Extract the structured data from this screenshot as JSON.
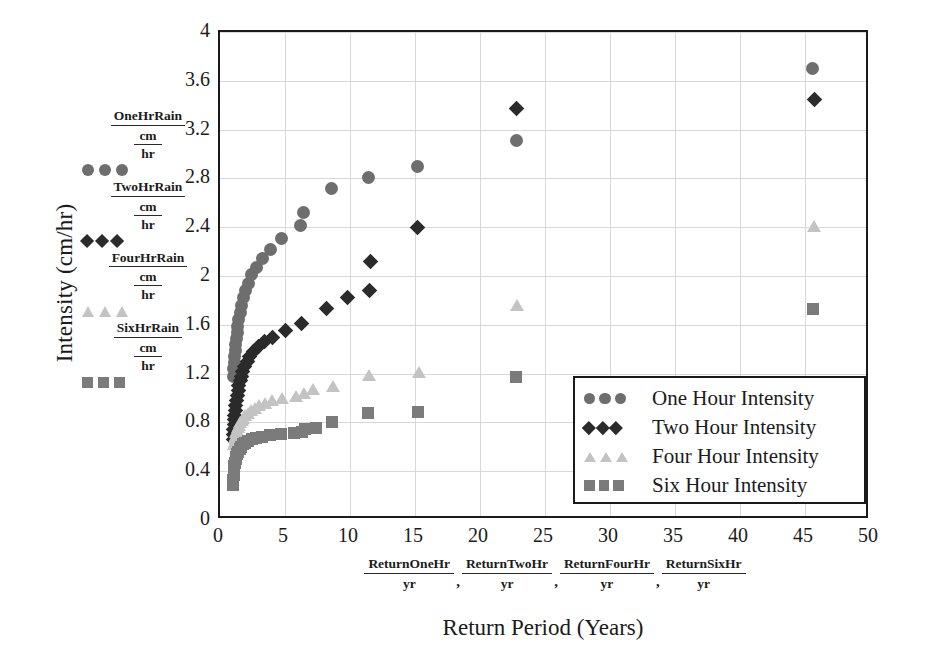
{
  "axes": {
    "y_title": "Intensity (cm/hr)",
    "x_title": "Return Period (Years)",
    "y_ticks": [
      "0",
      "0.4",
      "0.8",
      "1.2",
      "1.6",
      "2",
      "2.4",
      "2.8",
      "3.2",
      "3.6",
      "4"
    ],
    "x_ticks": [
      "0",
      "5",
      "10",
      "15",
      "20",
      "25",
      "30",
      "35",
      "40",
      "45",
      "50"
    ]
  },
  "left_legend": {
    "items": [
      {
        "numerator": "OneHrRain",
        "unit_top": "cm",
        "unit_bottom": "hr",
        "marker": "circle",
        "color": "#6e6e6e"
      },
      {
        "numerator": "TwoHrRain",
        "unit_top": "cm",
        "unit_bottom": "hr",
        "marker": "diamond",
        "color": "#2b2b2b"
      },
      {
        "numerator": "FourHrRain",
        "unit_top": "cm",
        "unit_bottom": "hr",
        "marker": "triangle",
        "color": "#c3c3c3"
      },
      {
        "numerator": "SixHrRain",
        "unit_top": "cm",
        "unit_bottom": "hr",
        "marker": "square",
        "color": "#7b7b7b"
      }
    ]
  },
  "x_fraction_row": {
    "items": [
      {
        "numerator": "ReturnOneHr",
        "denominator": "yr"
      },
      {
        "numerator": "ReturnTwoHr",
        "denominator": "yr"
      },
      {
        "numerator": "ReturnFourHr",
        "denominator": "yr"
      },
      {
        "numerator": "ReturnSixHr",
        "denominator": "yr"
      }
    ],
    "separator": ","
  },
  "series_legend": {
    "items": [
      {
        "label": "One Hour Intensity",
        "marker": "circle",
        "color": "#6e6e6e"
      },
      {
        "label": "Two Hour Intensity",
        "marker": "diamond",
        "color": "#2b2b2b"
      },
      {
        "label": "Four Hour Intensity",
        "marker": "triangle",
        "color": "#c3c3c3"
      },
      {
        "label": "Six Hour Intensity",
        "marker": "square",
        "color": "#7b7b7b"
      }
    ]
  },
  "chart_data": {
    "type": "scatter",
    "title": "",
    "xlabel": "Return Period (Years)",
    "ylabel": "Intensity (cm/hr)",
    "xlim": [
      0,
      50
    ],
    "ylim": [
      0,
      4
    ],
    "xtick_step": 5,
    "ytick_step": 0.4,
    "grid": true,
    "legend_position": "inside-lower-right",
    "series": [
      {
        "name": "One Hour Intensity",
        "marker": "circle",
        "color": "#6e6e6e",
        "points": [
          [
            1.02,
            1.18
          ],
          [
            1.05,
            1.24
          ],
          [
            1.08,
            1.29
          ],
          [
            1.12,
            1.34
          ],
          [
            1.16,
            1.39
          ],
          [
            1.2,
            1.44
          ],
          [
            1.25,
            1.49
          ],
          [
            1.31,
            1.54
          ],
          [
            1.38,
            1.59
          ],
          [
            1.46,
            1.64
          ],
          [
            1.55,
            1.7
          ],
          [
            1.66,
            1.76
          ],
          [
            1.8,
            1.82
          ],
          [
            1.97,
            1.88
          ],
          [
            2.18,
            1.94
          ],
          [
            2.45,
            2.01
          ],
          [
            2.8,
            2.07
          ],
          [
            3.25,
            2.14
          ],
          [
            3.85,
            2.22
          ],
          [
            4.7,
            2.31
          ],
          [
            6.2,
            2.41
          ],
          [
            6.45,
            2.52
          ],
          [
            8.6,
            2.72
          ],
          [
            11.4,
            2.81
          ],
          [
            15.2,
            2.9
          ],
          [
            22.8,
            3.11
          ],
          [
            45.6,
            3.7
          ]
        ]
      },
      {
        "name": "Two Hour Intensity",
        "marker": "diamond",
        "color": "#2b2b2b",
        "points": [
          [
            1.02,
            0.66
          ],
          [
            1.04,
            0.7
          ],
          [
            1.06,
            0.74
          ],
          [
            1.09,
            0.78
          ],
          [
            1.12,
            0.82
          ],
          [
            1.15,
            0.86
          ],
          [
            1.19,
            0.9
          ],
          [
            1.23,
            0.94
          ],
          [
            1.28,
            0.98
          ],
          [
            1.33,
            1.02
          ],
          [
            1.39,
            1.06
          ],
          [
            1.46,
            1.1
          ],
          [
            1.54,
            1.14
          ],
          [
            1.64,
            1.18
          ],
          [
            1.76,
            1.22
          ],
          [
            1.9,
            1.26
          ],
          [
            2.08,
            1.3
          ],
          [
            2.3,
            1.34
          ],
          [
            2.58,
            1.38
          ],
          [
            2.95,
            1.42
          ],
          [
            3.42,
            1.46
          ],
          [
            4.05,
            1.5
          ],
          [
            5.0,
            1.55
          ],
          [
            6.3,
            1.61
          ],
          [
            8.2,
            1.73
          ],
          [
            9.8,
            1.82
          ],
          [
            11.5,
            1.88
          ],
          [
            11.6,
            2.12
          ],
          [
            15.2,
            2.4
          ],
          [
            22.8,
            3.37
          ],
          [
            45.7,
            3.45
          ]
        ]
      },
      {
        "name": "Four Hour Intensity",
        "marker": "triangle",
        "color": "#c3c3c3",
        "points": [
          [
            1.02,
            0.62
          ],
          [
            1.05,
            0.65
          ],
          [
            1.09,
            0.68
          ],
          [
            1.13,
            0.7
          ],
          [
            1.18,
            0.72
          ],
          [
            1.24,
            0.74
          ],
          [
            1.31,
            0.76
          ],
          [
            1.39,
            0.78
          ],
          [
            1.48,
            0.8
          ],
          [
            1.59,
            0.82
          ],
          [
            1.72,
            0.84
          ],
          [
            1.88,
            0.86
          ],
          [
            2.07,
            0.88
          ],
          [
            2.3,
            0.9
          ],
          [
            2.58,
            0.92
          ],
          [
            2.93,
            0.94
          ],
          [
            3.38,
            0.96
          ],
          [
            3.95,
            0.98
          ],
          [
            4.72,
            1.0
          ],
          [
            5.78,
            1.02
          ],
          [
            6.4,
            1.04
          ],
          [
            7.1,
            1.07
          ],
          [
            8.6,
            1.1
          ],
          [
            11.4,
            1.19
          ],
          [
            15.2,
            1.21
          ],
          [
            22.8,
            1.76
          ],
          [
            45.6,
            2.41
          ]
        ]
      },
      {
        "name": "Six Hour Intensity",
        "marker": "square",
        "color": "#7b7b7b",
        "points": [
          [
            1.02,
            0.29
          ],
          [
            1.03,
            0.33
          ],
          [
            1.05,
            0.37
          ],
          [
            1.08,
            0.41
          ],
          [
            1.11,
            0.44
          ],
          [
            1.15,
            0.47
          ],
          [
            1.2,
            0.5
          ],
          [
            1.26,
            0.52
          ],
          [
            1.33,
            0.54
          ],
          [
            1.41,
            0.56
          ],
          [
            1.51,
            0.58
          ],
          [
            1.63,
            0.6
          ],
          [
            1.78,
            0.62
          ],
          [
            1.96,
            0.63
          ],
          [
            2.18,
            0.645
          ],
          [
            2.45,
            0.66
          ],
          [
            2.8,
            0.672
          ],
          [
            3.25,
            0.684
          ],
          [
            3.85,
            0.695
          ],
          [
            4.7,
            0.705
          ],
          [
            5.7,
            0.715
          ],
          [
            6.3,
            0.72
          ],
          [
            6.5,
            0.745
          ],
          [
            7.4,
            0.752
          ],
          [
            8.6,
            0.8
          ],
          [
            11.4,
            0.875
          ],
          [
            15.2,
            0.885
          ],
          [
            22.8,
            1.17
          ],
          [
            45.6,
            1.73
          ]
        ]
      }
    ]
  }
}
